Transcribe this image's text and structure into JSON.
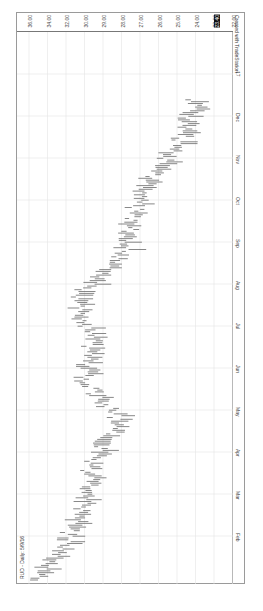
{
  "chart_data": {
    "type": "line",
    "orientation": "rotated-90-clockwise",
    "title": "RUD - Daily: 5/9/16",
    "credit": "Created with TradeStation",
    "ylabel": "Price",
    "y_ticks": [
      "36.00",
      "34.00",
      "32.00",
      "30.00",
      "29.00",
      "28.00",
      "27.00",
      "26.00",
      "25.00",
      "24.00",
      "23.00",
      "22.00"
    ],
    "highlighted_price": "23.40",
    "x_ticks": [
      "Feb",
      "Mar",
      "Apr",
      "May",
      "Jun",
      "Jul",
      "Aug",
      "Sep",
      "Oct",
      "Nov",
      "Dec",
      "17"
    ],
    "ylim": [
      21.5,
      36.5
    ],
    "grid": true,
    "series": [
      {
        "name": "RUD daily range",
        "x": [
          "Jan",
          "Feb",
          "Mar",
          "Apr",
          "May",
          "Jun",
          "Jul",
          "Aug",
          "Sep",
          "Oct",
          "Nov",
          "Dec",
          "Jan17"
        ],
        "values": [
          35.6,
          33.2,
          32.0,
          31.4,
          29.6,
          32.2,
          31.6,
          32.8,
          29.4,
          28.8,
          27.6,
          25.4,
          24.2
        ]
      }
    ]
  },
  "labels": {
    "title": "RUD - Daily: 5/9/16",
    "credit": "Created with TradeStation"
  }
}
